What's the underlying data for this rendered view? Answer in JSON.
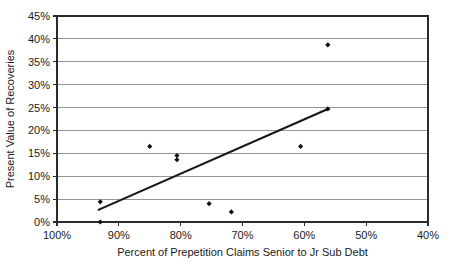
{
  "chart_data": {
    "type": "scatter",
    "title": "",
    "xlabel": "Percent of Prepetition Claims Senior to Jr Sub Debt",
    "ylabel": "Present Value of Recoveries",
    "x_tick_labels": [
      "100%",
      "90%",
      "80%",
      "70%",
      "60%",
      "50%",
      "40%"
    ],
    "x_tick_values": [
      100,
      90,
      80,
      70,
      60,
      50,
      40
    ],
    "y_tick_labels": [
      "0%",
      "5%",
      "10%",
      "15%",
      "20%",
      "25%",
      "30%",
      "35%",
      "40%",
      "45%"
    ],
    "y_tick_values": [
      0,
      5,
      10,
      15,
      20,
      25,
      30,
      35,
      40,
      45
    ],
    "xlim": [
      100,
      40
    ],
    "ylim": [
      0,
      45
    ],
    "x_axis_reversed": true,
    "grid": "horizontal",
    "legend": "none",
    "marker": "diamond",
    "points": [
      {
        "x": 93.0,
        "y": 4.4
      },
      {
        "x": 93.0,
        "y": 0.0
      },
      {
        "x": 85.0,
        "y": 16.5
      },
      {
        "x": 80.6,
        "y": 14.5
      },
      {
        "x": 80.6,
        "y": 13.6
      },
      {
        "x": 75.4,
        "y": 4.0
      },
      {
        "x": 71.8,
        "y": 2.2
      },
      {
        "x": 60.6,
        "y": 16.5
      },
      {
        "x": 56.2,
        "y": 38.7
      },
      {
        "x": 56.2,
        "y": 24.7
      }
    ],
    "trendline": {
      "name": "linear-fit",
      "x0": 93.4,
      "y0": 2.6,
      "x1": 56.2,
      "y1": 24.7
    },
    "colors": {
      "marker": "#111111",
      "trendline": "#171717",
      "gridline": "#8a8a8a",
      "frame": "#2b2b2b",
      "background": "#ffffff"
    }
  }
}
